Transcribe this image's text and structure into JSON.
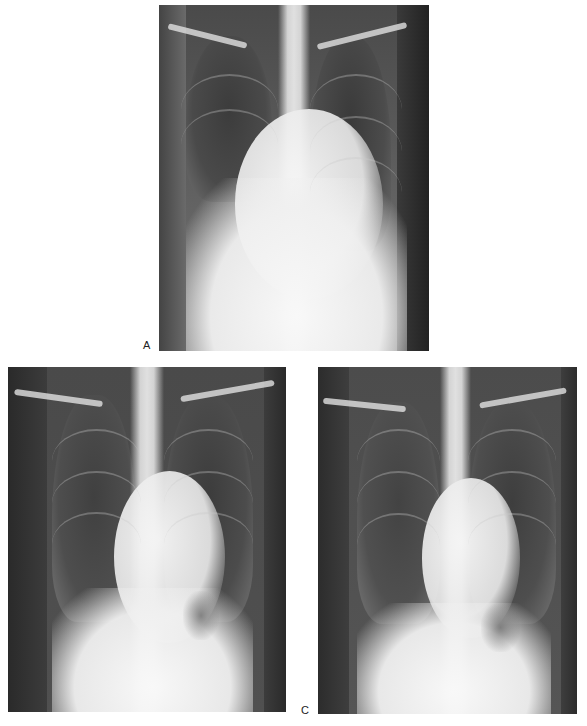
{
  "figure": {
    "type": "chest radiograph series",
    "panels": [
      {
        "id": "A",
        "label": "A",
        "description": "Frontal chest X-ray with large left-sided opacity/elevated hemidiaphragm and right lower lung opacification"
      },
      {
        "id": "B",
        "label": "",
        "description": "Frontal chest X-ray, follow-up, clearer lung fields with gastric bubble under left hemidiaphragm"
      },
      {
        "id": "C",
        "label": "C",
        "description": "Frontal chest X-ray, later follow-up, lung fields largely aerated"
      }
    ]
  },
  "colors": {
    "background": "#ffffff",
    "film_dark": "#3a3a3a",
    "bone_light": "#e8e8e8"
  }
}
